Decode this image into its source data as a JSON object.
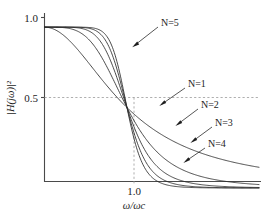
{
  "figure": {
    "type": "line-plot",
    "background": "#ffffff",
    "line_color": "#2b2b2b",
    "guide_color": "#9a9a9a",
    "axis_color": "#4a4a4a"
  },
  "axes": {
    "y_label": "|H(jω)|²",
    "x_label": "ω/ωc",
    "y_ticks": [
      "1.0",
      "0.5"
    ],
    "x_ticks": [
      "1.0"
    ]
  },
  "annotations": [
    {
      "text": "N=5",
      "order": 5
    },
    {
      "text": "N=1",
      "order": 1
    },
    {
      "text": "N=2",
      "order": 2
    },
    {
      "text": "N=3",
      "order": 3
    },
    {
      "text": "N=4",
      "order": 4
    }
  ],
  "chart_data": {
    "type": "line",
    "title": "",
    "subtitle": "",
    "xlabel": "ω/ωc",
    "ylabel": "|H(jω)|²",
    "xlim": [
      0,
      2.6
    ],
    "ylim": [
      0,
      1.06
    ],
    "grid": false,
    "legend_position": "inline-annotations",
    "x_ticks": [
      1.0
    ],
    "x_tick_labels": [
      "1.0"
    ],
    "y_ticks": [
      0.5,
      1.0
    ],
    "y_tick_labels": [
      "0.5",
      "1.0"
    ],
    "guide_lines": [
      {
        "orientation": "horizontal",
        "value": 0.5,
        "style": "dashed"
      },
      {
        "orientation": "vertical",
        "value": 1.0,
        "style": "dashed"
      }
    ],
    "formula": "|H(jw)|^2 = 1 / (1 + (w/wc)^(2N))",
    "x": [
      0.0,
      0.1,
      0.2,
      0.3,
      0.4,
      0.5,
      0.6,
      0.7,
      0.8,
      0.9,
      1.0,
      1.1,
      1.2,
      1.3,
      1.4,
      1.5,
      1.6,
      1.8,
      2.0,
      2.2,
      2.4,
      2.6
    ],
    "series": [
      {
        "name": "N=1",
        "N": 1,
        "values": [
          1.0,
          0.99,
          0.962,
          0.917,
          0.862,
          0.8,
          0.735,
          0.671,
          0.61,
          0.552,
          0.5,
          0.453,
          0.41,
          0.372,
          0.338,
          0.308,
          0.281,
          0.236,
          0.2,
          0.171,
          0.148,
          0.129
        ]
      },
      {
        "name": "N=2",
        "N": 2,
        "values": [
          1.0,
          1.0,
          0.998,
          0.992,
          0.975,
          0.941,
          0.885,
          0.806,
          0.709,
          0.604,
          0.5,
          0.406,
          0.326,
          0.259,
          0.206,
          0.165,
          0.132,
          0.087,
          0.059,
          0.041,
          0.03,
          0.022
        ]
      },
      {
        "name": "N=3",
        "N": 3,
        "values": [
          1.0,
          1.0,
          1.0,
          0.999,
          0.996,
          0.985,
          0.956,
          0.896,
          0.795,
          0.653,
          0.5,
          0.358,
          0.243,
          0.16,
          0.104,
          0.068,
          0.044,
          0.019,
          0.008,
          0.004,
          0.002,
          0.001
        ]
      },
      {
        "name": "N=4",
        "N": 4,
        "values": [
          1.0,
          1.0,
          1.0,
          1.0,
          0.999,
          0.996,
          0.983,
          0.945,
          0.855,
          0.699,
          0.5,
          0.31,
          0.17,
          0.086,
          0.041,
          0.019,
          0.009,
          0.002,
          0.001,
          0.0,
          0.0,
          0.0
        ]
      },
      {
        "name": "N=5",
        "N": 5,
        "values": [
          1.0,
          1.0,
          1.0,
          1.0,
          1.0,
          0.999,
          0.994,
          0.972,
          0.9,
          0.74,
          0.5,
          0.266,
          0.114,
          0.044,
          0.016,
          0.005,
          0.002,
          0.0,
          0.0,
          0.0,
          0.0,
          0.0
        ]
      }
    ]
  }
}
